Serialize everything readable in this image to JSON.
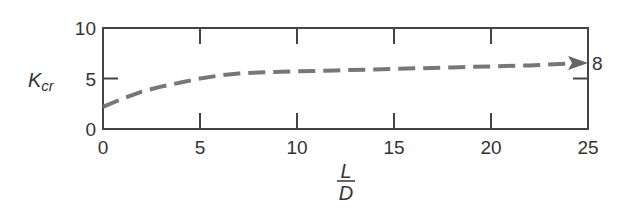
{
  "chart_data": {
    "type": "line",
    "title": "",
    "xlabel": "L/D",
    "ylabel": "K_cr",
    "xlim": [
      0,
      25
    ],
    "ylim": [
      0,
      10
    ],
    "xticks": [
      0,
      5,
      10,
      15,
      20,
      25
    ],
    "yticks": [
      0,
      5,
      10
    ],
    "grid": false,
    "legend": null,
    "series": [
      {
        "name": "K_cr",
        "style": "dashed",
        "color": "#777777",
        "x": [
          0,
          1,
          2,
          3,
          4,
          5,
          6,
          7,
          8,
          10,
          12,
          15,
          18,
          20,
          22,
          25
        ],
        "y": [
          2.2,
          3.0,
          3.7,
          4.2,
          4.6,
          5.0,
          5.3,
          5.5,
          5.6,
          5.7,
          5.8,
          5.95,
          6.1,
          6.2,
          6.3,
          6.5
        ]
      }
    ],
    "annotations": [
      {
        "text": "8",
        "x": 25,
        "y": 6.5,
        "note": "arrow points to right axis label"
      }
    ]
  },
  "labels": {
    "y_axis_main": "K",
    "y_axis_sub": "cr",
    "x_axis_num": "L",
    "x_axis_den": "D",
    "arrow_label": "8",
    "xtick_0": "0",
    "xtick_1": "5",
    "xtick_2": "10",
    "xtick_3": "15",
    "xtick_4": "20",
    "xtick_5": "25",
    "ytick_0": "0",
    "ytick_1": "5",
    "ytick_2": "10"
  }
}
